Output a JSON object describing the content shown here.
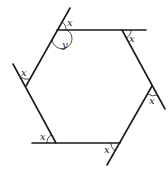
{
  "diagram": {
    "type": "geometry",
    "shape": "hexagon",
    "vertices": [
      {
        "name": "top-left",
        "x": 57,
        "y": 30
      },
      {
        "name": "top-right",
        "x": 122,
        "y": 30
      },
      {
        "name": "right",
        "x": 152,
        "y": 86
      },
      {
        "name": "bottom-right",
        "x": 120,
        "y": 143
      },
      {
        "name": "bottom-left",
        "x": 56,
        "y": 143
      },
      {
        "name": "left",
        "x": 26,
        "y": 86
      }
    ],
    "labels": {
      "exterior_angle": "x",
      "interior_angle": "y"
    },
    "angle_labels": [
      {
        "id": "top-left-exterior",
        "text": "x",
        "x": 67,
        "y": 26
      },
      {
        "id": "top-left-interior",
        "text": "y",
        "x": 62,
        "y": 47
      },
      {
        "id": "top-right-exterior",
        "text": "x",
        "x": 130,
        "y": 42
      },
      {
        "id": "right-exterior",
        "text": "x",
        "x": 149,
        "y": 103
      },
      {
        "id": "bottom-right-exterior",
        "text": "x",
        "x": 104,
        "y": 152
      },
      {
        "id": "bottom-left-exterior",
        "text": "x",
        "x": 41,
        "y": 140
      },
      {
        "id": "left-exterior",
        "text": "x",
        "x": 21,
        "y": 77
      }
    ]
  }
}
